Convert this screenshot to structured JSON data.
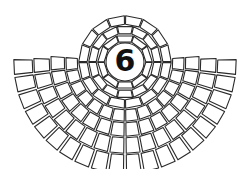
{
  "figure": {
    "label": "6",
    "colors": {
      "line": "#2a2a2a",
      "background": "#ffffff",
      "label": "#111111"
    }
  }
}
